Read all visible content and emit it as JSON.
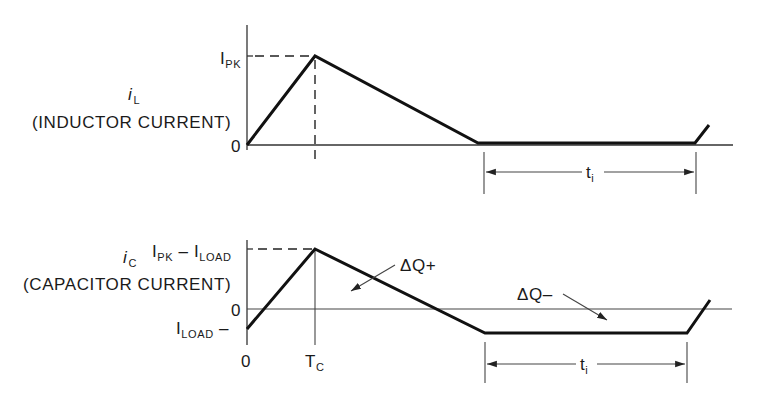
{
  "colors": {
    "ink": "#111111",
    "background": "#ffffff"
  },
  "top_plot": {
    "signal_symbol": "i",
    "signal_subscript": "L",
    "signal_description": "(INDUCTOR CURRENT)",
    "y_tick_peak_main": "I",
    "y_tick_peak_sub": "PK",
    "y_tick_zero": "0",
    "interval_label_main": "t",
    "interval_label_sub": "i"
  },
  "bottom_plot": {
    "signal_symbol": "i",
    "signal_subscript": "C",
    "signal_description": "(CAPACITOR CURRENT)",
    "y_tick_peak_I1": "I",
    "y_tick_peak_sub1": "PK",
    "y_tick_peak_minus": " – ",
    "y_tick_peak_I2": "I",
    "y_tick_peak_sub2": "LOAD",
    "y_tick_zero": "0",
    "y_tick_load_main": "I",
    "y_tick_load_sub": "LOAD",
    "y_tick_load_suffix": " –",
    "x_tick_zero": "0",
    "x_tick_tc_main": "T",
    "x_tick_tc_sub": "C",
    "annotation_positive": "ΔQ+",
    "annotation_negative": "ΔQ–",
    "interval_label_main": "t",
    "interval_label_sub": "i"
  }
}
